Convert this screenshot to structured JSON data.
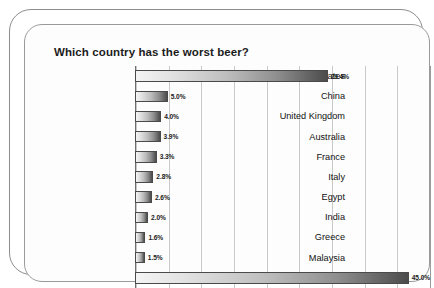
{
  "chart_data": {
    "type": "bar",
    "orientation": "horizontal",
    "title": "Which country has the worst beer?",
    "xlabel": "",
    "ylabel": "",
    "xlim": [
      0,
      45
    ],
    "grid": true,
    "gridline_interval": 5,
    "legend": "none",
    "value_suffix": "%",
    "categories": [
      "United States",
      "China",
      "United Kingdom",
      "Australia",
      "France",
      "Italy",
      "Egypt",
      "India",
      "Greece",
      "Malaysia",
      "Other"
    ],
    "values": [
      29.4,
      5.0,
      4.0,
      3.9,
      3.3,
      2.8,
      2.6,
      2.0,
      1.6,
      1.5,
      45.0
    ],
    "value_labels": [
      "29.4%",
      "5.0%",
      "4.0%",
      "3.9%",
      "3.3%",
      "2.8%",
      "2.6%",
      "2.0%",
      "1.6%",
      "1.5%",
      "45.0%"
    ]
  },
  "colors": {
    "bar_light": "#f4f4f4",
    "bar_dark": "#4b4b4b",
    "bar_outline": "#4a4a4a",
    "gridline": "#c9c9c9",
    "axis": "#6f6f6f",
    "frame": "#8d8d8d",
    "title_text": "#1c1c1c",
    "label_text": "#111111"
  }
}
